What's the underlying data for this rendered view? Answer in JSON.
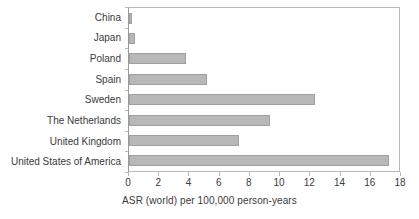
{
  "chart_data": {
    "type": "bar",
    "orientation": "horizontal",
    "title": "",
    "subtitle": "",
    "xlabel": "ASR (world) per 100,000 person-years",
    "ylabel": "",
    "categories": [
      "China",
      "Japan",
      "Poland",
      "Spain",
      "Sweden",
      "The Netherlands",
      "United Kingdom",
      "United States of America"
    ],
    "values": [
      0.2,
      0.4,
      3.8,
      5.2,
      12.4,
      9.4,
      7.3,
      17.3
    ],
    "xlim": [
      0,
      18
    ],
    "xticks": [
      0,
      2,
      4,
      6,
      8,
      10,
      12,
      14,
      16,
      18
    ],
    "xtick_labels": [
      "0",
      "2",
      "4",
      "6",
      "8",
      "10",
      "12",
      "14",
      "16",
      "18"
    ],
    "grid": false,
    "legend": false,
    "legend_position": "none",
    "bar_fill_color": "#b8b8b8",
    "bar_edge_color": "#a0a0a0",
    "axis_color": "#b9b9b9",
    "text_color": "#3a3a3a",
    "background_color": "#ffffff"
  }
}
